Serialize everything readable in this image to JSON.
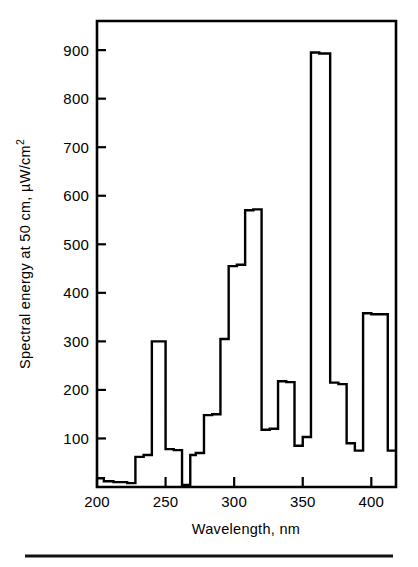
{
  "figure": {
    "background_color": "#ffffff",
    "ink_color": "#000000",
    "has_bottom_rule": true
  },
  "chart_data": {
    "type": "line",
    "style": "step",
    "title": "",
    "subtitle": "",
    "xlabel": "Wavelength, nm",
    "ylabel": "Spectral energy at 50 cm, µW/cm²",
    "ylabel_parts": {
      "main": "Spectral energy at 50 cm, µW/cm",
      "superscript": "2"
    },
    "xlim": [
      200,
      418
    ],
    "ylim": [
      0,
      960
    ],
    "xticks": [
      200,
      250,
      300,
      350,
      400
    ],
    "xtick_labels": [
      "200",
      "250",
      "300",
      "350",
      "400"
    ],
    "yticks": [
      100,
      200,
      300,
      400,
      500,
      600,
      700,
      800,
      900
    ],
    "ytick_labels": [
      "100",
      "200",
      "300",
      "400",
      "500",
      "600",
      "700",
      "800",
      "900"
    ],
    "grid": false,
    "legend": null,
    "legend_position": "none",
    "series": [
      {
        "name": "Spectral energy",
        "step_edges": [
          200,
          205,
          212,
          222,
          228,
          234,
          240,
          250,
          256,
          262,
          268,
          272,
          278,
          284,
          290,
          296,
          302,
          308,
          314,
          320,
          326,
          332,
          338,
          344,
          350,
          356,
          362,
          370,
          376,
          382,
          388,
          394,
          400,
          412,
          418
        ],
        "step_values": [
          18,
          12,
          10,
          8,
          62,
          66,
          300,
          78,
          76,
          4,
          66,
          70,
          148,
          150,
          305,
          455,
          458,
          570,
          572,
          118,
          120,
          218,
          216,
          85,
          103,
          895,
          893,
          215,
          212,
          90,
          75,
          358,
          356,
          75
        ]
      }
    ],
    "peaks": [
      {
        "wavelength_nm": 245,
        "value": 300
      },
      {
        "wavelength_nm": 313,
        "value": 572
      },
      {
        "wavelength_nm": 366,
        "value": 895
      },
      {
        "wavelength_nm": 406,
        "value": 358
      },
      {
        "wavelength_nm": 335,
        "value": 218
      }
    ]
  }
}
